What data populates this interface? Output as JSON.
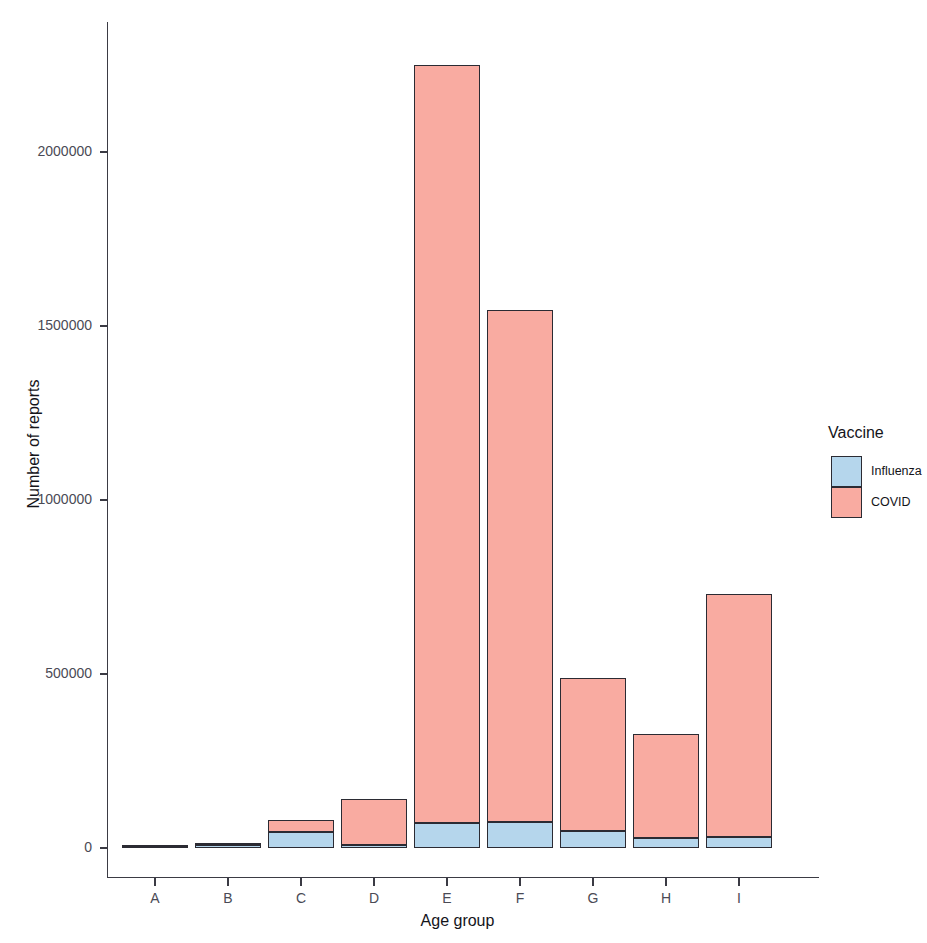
{
  "chart_data": {
    "type": "bar",
    "subtype": "stacked",
    "title": "",
    "xlabel": "Age group",
    "ylabel": "Number of reports",
    "categories": [
      "A",
      "B",
      "C",
      "D",
      "E",
      "F",
      "G",
      "H",
      "I"
    ],
    "series": [
      {
        "name": "Influenza",
        "color": "#b5d6ec",
        "values": [
          1200,
          9000,
          46000,
          9000,
          72000,
          76000,
          49000,
          29000,
          32000
        ]
      },
      {
        "name": "COVID",
        "color": "#f9aba1",
        "values": [
          800,
          6000,
          34000,
          131000,
          2178000,
          1470000,
          439000,
          298000,
          698000
        ]
      }
    ],
    "totals": [
      2000,
      15000,
      80000,
      140000,
      2250000,
      1546000,
      488000,
      327000,
      730000
    ],
    "ylim": [
      0,
      2300000
    ],
    "yticks": [
      0,
      500000,
      1000000,
      1500000,
      2000000
    ],
    "ytick_labels": [
      "0",
      "500000",
      "1000000",
      "1500000",
      "2000000"
    ],
    "grid": false,
    "legend": {
      "title": "Vaccine",
      "position": "right",
      "entries": [
        {
          "label": "Influenza",
          "color": "#b5d6ec"
        },
        {
          "label": "COVID",
          "color": "#f9aba1"
        }
      ]
    },
    "bar_outline_color": "#2b2b33",
    "background_color": "#ffffff"
  }
}
